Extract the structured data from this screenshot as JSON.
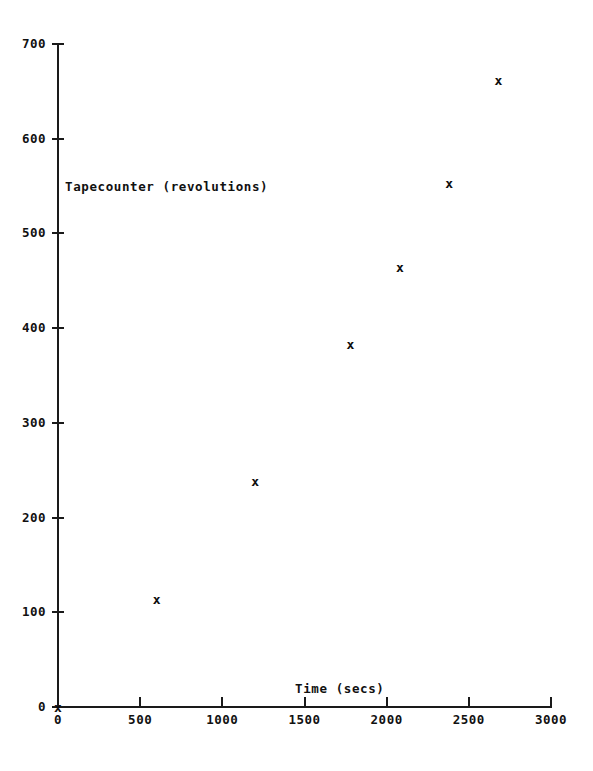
{
  "chart_data": {
    "type": "scatter",
    "title": "",
    "xlabel": "Time (secs)",
    "ylabel": "Tapecounter (revolutions)",
    "xlim": [
      0,
      3000
    ],
    "ylim": [
      0,
      700
    ],
    "xticks": [
      0,
      500,
      1000,
      1500,
      2000,
      2500,
      3000
    ],
    "yticks": [
      0,
      100,
      200,
      300,
      400,
      500,
      600,
      700
    ],
    "xtick_labels": [
      "0",
      "500",
      "1000",
      "1500",
      "2000",
      "2500",
      "3000"
    ],
    "ytick_labels": [
      "0",
      "100",
      "200",
      "300",
      "400",
      "500",
      "600",
      "700"
    ],
    "grid": false,
    "legend": null,
    "marker": "x",
    "marker_color": "#0d0d0d",
    "axis_color": "#1a1a1a",
    "background": "#ffffff",
    "points": [
      {
        "x": 0,
        "y": 0,
        "label": "x"
      },
      {
        "x": 600,
        "y": 113,
        "label": "x"
      },
      {
        "x": 1200,
        "y": 238,
        "label": "x"
      },
      {
        "x": 1780,
        "y": 383,
        "label": "x"
      },
      {
        "x": 2080,
        "y": 464,
        "label": "x"
      },
      {
        "x": 2380,
        "y": 553,
        "label": "x"
      },
      {
        "x": 2680,
        "y": 661,
        "label": "x"
      }
    ]
  }
}
